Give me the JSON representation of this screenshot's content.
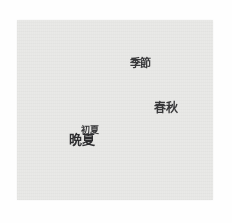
{
  "page": {
    "background_color": "#fefefe",
    "canvas_color": "#e9e9e7",
    "text_color": "#38383a"
  },
  "chart_data": {
    "type": "scatter",
    "title": "",
    "xlabel": "",
    "ylabel": "",
    "axes_visible": false,
    "grid": false,
    "legend": false,
    "points": [
      {
        "label": "季節",
        "x": 0.63,
        "y": 0.24,
        "size": 11
      },
      {
        "label": "春秋",
        "x": 0.76,
        "y": 0.49,
        "size": 12
      },
      {
        "label": "初夏",
        "x": 0.37,
        "y": 0.61,
        "size": 9
      },
      {
        "label": "晩夏",
        "x": 0.33,
        "y": 0.66,
        "size": 13
      }
    ],
    "xlim": [
      0,
      1
    ],
    "ylim": [
      0,
      1
    ]
  }
}
